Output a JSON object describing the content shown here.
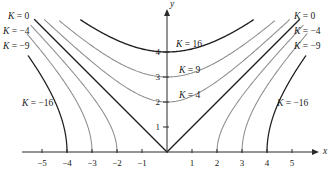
{
  "figure": {
    "name": "level-curves-plot",
    "width": 334,
    "height": 180,
    "background": "#ffffff"
  },
  "axes": {
    "x_label": "x",
    "y_label": "y",
    "x_ticks": [
      {
        "value": -5,
        "label": "-5"
      },
      {
        "value": -4,
        "label": "-4"
      },
      {
        "value": -3,
        "label": "-3"
      },
      {
        "value": -2,
        "label": "-2"
      },
      {
        "value": -1,
        "label": "-1"
      },
      {
        "value": 1,
        "label": "1"
      },
      {
        "value": 2,
        "label": "2"
      },
      {
        "value": 3,
        "label": "3"
      },
      {
        "value": 4,
        "label": "4"
      },
      {
        "value": 5,
        "label": "5"
      }
    ],
    "y_ticks": [
      {
        "value": 1,
        "label": "1"
      },
      {
        "value": 2,
        "label": "2"
      },
      {
        "value": 3,
        "label": "3"
      },
      {
        "value": 4,
        "label": "4"
      }
    ],
    "xlim": [
      -5.8,
      5.8
    ],
    "ylim": [
      -0.4,
      6.0
    ],
    "origin_px": [
      167,
      152
    ],
    "unit_px": 25,
    "axis_color": "#2b2b2b"
  },
  "chart_data": {
    "type": "line",
    "title": "",
    "xlabel": "x",
    "ylabel": "y",
    "xlim": [
      -5.8,
      5.8
    ],
    "ylim": [
      -0.4,
      6.0
    ],
    "grid": false,
    "legend": "inline-labels",
    "equation_family": "y = sqrt(x^2 + K)",
    "series": [
      {
        "name": "K = 16",
        "k": 16,
        "kind": "hyperbola-up",
        "color": "#1f1f1f",
        "width": 1.35,
        "vertex": [
          0,
          4
        ],
        "x_range": [
          -3.45,
          3.45
        ]
      },
      {
        "name": "K = 9",
        "k": 9,
        "kind": "hyperbola-up",
        "color": "#8d8d8d",
        "width": 1.05,
        "vertex": [
          0,
          3
        ],
        "x_range": [
          -4.3,
          4.3
        ]
      },
      {
        "name": "K = 4",
        "k": 4,
        "kind": "hyperbola-up",
        "color": "#8d8d8d",
        "width": 1.05,
        "vertex": [
          0,
          2
        ],
        "x_range": [
          -4.9,
          4.9
        ]
      },
      {
        "name": "K = 0",
        "k": 0,
        "kind": "asymptote-v",
        "color": "#1f1f1f",
        "width": 1.35,
        "vertex": [
          0,
          0
        ],
        "x_range": [
          -5.3,
          5.3
        ]
      },
      {
        "name": "K = -4",
        "k": -4,
        "kind": "hyperbola-side",
        "color": "#8d8d8d",
        "width": 1.05,
        "vertex": [
          2,
          0
        ],
        "x_range": [
          2,
          5.45
        ]
      },
      {
        "name": "K = -9",
        "k": -9,
        "kind": "hyperbola-side",
        "color": "#8d8d8d",
        "width": 1.05,
        "vertex": [
          3,
          0
        ],
        "x_range": [
          3,
          5.6
        ]
      },
      {
        "name": "K = -16",
        "k": -16,
        "kind": "hyperbola-side",
        "color": "#1f1f1f",
        "width": 1.25,
        "vertex": [
          4,
          0
        ],
        "x_range": [
          4,
          5.55
        ]
      }
    ]
  },
  "labels": {
    "left": [
      {
        "name": "label-k-0-left",
        "k_text": "K",
        "eq": "=",
        "value": "0",
        "x": 8,
        "y": 12
      },
      {
        "name": "label-k-neg4-left",
        "k_text": "K",
        "eq": "=",
        "value": "-4",
        "x": 3,
        "y": 27
      },
      {
        "name": "label-k-neg9-left",
        "k_text": "K",
        "eq": "=",
        "value": "-9",
        "x": 3,
        "y": 42
      },
      {
        "name": "label-k-neg16-left",
        "k_text": "K",
        "eq": "=",
        "value": "-16",
        "x": 22,
        "y": 99
      }
    ],
    "right": [
      {
        "name": "label-k-0-right",
        "k_text": "K",
        "eq": "=",
        "value": "0",
        "x": 294,
        "y": 12
      },
      {
        "name": "label-k-neg4-right",
        "k_text": "K",
        "eq": "=",
        "value": "-4",
        "x": 294,
        "y": 27
      },
      {
        "name": "label-k-neg9-right",
        "k_text": "K",
        "eq": "=",
        "value": "-9",
        "x": 294,
        "y": 42
      },
      {
        "name": "label-k-neg16-right",
        "k_text": "K",
        "eq": "=",
        "value": "-16",
        "x": 277,
        "y": 99
      }
    ],
    "center": [
      {
        "name": "label-k-16",
        "k_text": "K",
        "eq": "=",
        "value": "16",
        "x": 176,
        "y": 40
      },
      {
        "name": "label-k-9",
        "k_text": "K",
        "eq": "=",
        "value": "9",
        "x": 179,
        "y": 66
      },
      {
        "name": "label-k-4",
        "k_text": "K",
        "eq": "=",
        "value": "4",
        "x": 179,
        "y": 91
      }
    ]
  }
}
